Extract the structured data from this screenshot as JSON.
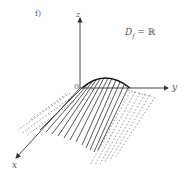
{
  "figure": {
    "panel_label": "f)",
    "domain_text": "D_f = ℝ",
    "domain_main": "D",
    "domain_sub": "f",
    "domain_rest": " = ℝ",
    "axes": {
      "x": "x",
      "y": "y",
      "z": "z",
      "origin": "0"
    }
  },
  "colors": {
    "stroke": "#333333",
    "dashed": "#666666",
    "text": "#555555"
  }
}
